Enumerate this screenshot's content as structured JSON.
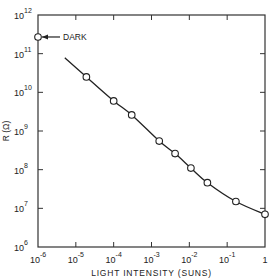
{
  "chart_data": {
    "type": "line",
    "title": "",
    "xlabel": "LIGHT INTENSITY (SUNS)",
    "ylabel": "R (Ω)",
    "xscale": "log",
    "yscale": "log",
    "xlim": [
      1e-06,
      1
    ],
    "ylim": [
      1000000.0,
      1000000000000.0
    ],
    "grid": false,
    "x_tick_labels": [
      {
        "base": "10",
        "exp": "-6",
        "value": -6
      },
      {
        "base": "10",
        "exp": "-5",
        "value": -5
      },
      {
        "base": "10",
        "exp": "-4",
        "value": -4
      },
      {
        "base": "10",
        "exp": "-3",
        "value": -3
      },
      {
        "base": "10",
        "exp": "-2",
        "value": -2
      },
      {
        "base": "10",
        "exp": "-1",
        "value": -1
      },
      {
        "base": "1",
        "exp": "",
        "value": 0
      }
    ],
    "y_tick_labels": [
      {
        "base": "10",
        "exp": "6",
        "value": 6
      },
      {
        "base": "10",
        "exp": "7",
        "value": 7
      },
      {
        "base": "10",
        "exp": "8",
        "value": 8
      },
      {
        "base": "10",
        "exp": "9",
        "value": 9
      },
      {
        "base": "10",
        "exp": "10",
        "value": 10
      },
      {
        "base": "10",
        "exp": "11",
        "value": 11
      },
      {
        "base": "10",
        "exp": "12",
        "value": 12
      }
    ],
    "series": [
      {
        "name": "R vs light intensity",
        "marker": "open-circle",
        "points": [
          {
            "x": 1.9e-05,
            "y": 25000000000.0
          },
          {
            "x": 0.0001,
            "y": 6000000000.0
          },
          {
            "x": 0.0003,
            "y": 2600000000.0
          },
          {
            "x": 0.0016,
            "y": 550000000.0
          },
          {
            "x": 0.0042,
            "y": 260000000.0
          },
          {
            "x": 0.011,
            "y": 110000000.0
          },
          {
            "x": 0.03,
            "y": 46000000.0
          },
          {
            "x": 0.17,
            "y": 15000000.0
          },
          {
            "x": 1.0,
            "y": 7000000.0
          }
        ],
        "curve_start": {
          "x": 5.1e-06,
          "y": 78000000000.0
        }
      }
    ],
    "annotations": [
      {
        "text": "DARK",
        "x": 1e-06,
        "y": 270000000000.0,
        "arrow": "left",
        "marker": "open-circle"
      }
    ]
  }
}
